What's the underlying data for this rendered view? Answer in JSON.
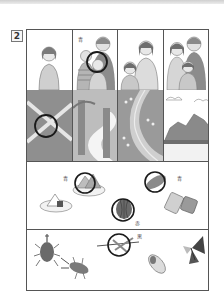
{
  "question": {
    "number": "2"
  },
  "row_people": {
    "panels": [
      {
        "id": "girl-alone"
      },
      {
        "id": "family-with-circle",
        "label": "青"
      },
      {
        "id": "girl-and-mother"
      },
      {
        "id": "family-of-three"
      }
    ]
  },
  "row_landscape": {
    "panels": [
      {
        "id": "field-crossroad-circled"
      },
      {
        "id": "forest-path"
      },
      {
        "id": "river-with-flowers"
      },
      {
        "id": "mountains"
      }
    ]
  },
  "food_section": {
    "items": [
      {
        "id": "sandwich-plate",
        "label": "青",
        "circled": true
      },
      {
        "id": "corn",
        "label": "青",
        "circled": true
      },
      {
        "id": "onigiri-plate",
        "circled": false
      },
      {
        "id": "watermelon",
        "label": "赤",
        "circled": true
      },
      {
        "id": "bento-box",
        "circled": false
      }
    ]
  },
  "insect_section": {
    "items": [
      {
        "id": "rhinoceros-beetle"
      },
      {
        "id": "stag-beetle"
      },
      {
        "id": "dragonfly",
        "label": "黒",
        "circled": true
      },
      {
        "id": "cicada"
      },
      {
        "id": "butterfly"
      }
    ]
  },
  "colors": {
    "line": "#555555",
    "circle": "#1a1a1a",
    "fill_gray": "#9a9a9a"
  }
}
